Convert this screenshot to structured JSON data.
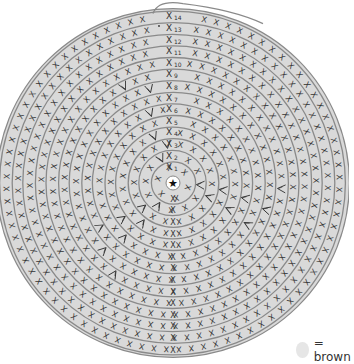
{
  "diagram": {
    "type": "crochet-chart",
    "shape": "spiral-circle",
    "rounds": 14,
    "center_symbol": "star-icon",
    "stitch_symbol": "X",
    "increase_symbol": "V",
    "round_labels": [
      "1",
      "2",
      "3",
      "4",
      "5",
      "6",
      "7",
      "8",
      "9",
      "10",
      "11",
      "12",
      "13",
      "14"
    ],
    "colors": {
      "fill": "#d9d9d9",
      "ring_line": "#8a8a8a",
      "stitch": "#333333",
      "background": "#ffffff"
    }
  },
  "legend": {
    "swatch_color": "#e6e6e6",
    "label": "= brown"
  }
}
